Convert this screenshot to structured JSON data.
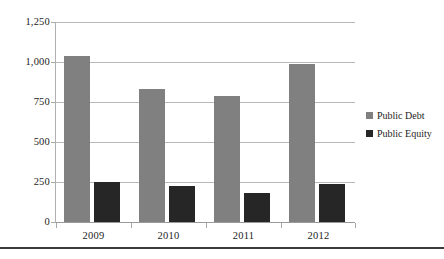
{
  "chart_data": {
    "type": "bar",
    "title": "",
    "subtitle": "",
    "xlabel": "",
    "ylabel": "",
    "categories": [
      "2009",
      "2010",
      "2011",
      "2012"
    ],
    "series": [
      {
        "name": "Public Debt",
        "color": "#808080",
        "values": [
          1035,
          832,
          785,
          985
        ]
      },
      {
        "name": "Public Equity",
        "color": "#262626",
        "values": [
          253,
          228,
          180,
          237
        ]
      }
    ],
    "ylim": [
      0,
      1250
    ],
    "y_ticks": [
      0,
      250,
      500,
      750,
      1000,
      1250
    ],
    "y_tick_labels": [
      "0",
      "250",
      "500",
      "750",
      "1,000",
      "1,250"
    ],
    "grid": true,
    "legend_position": "right"
  },
  "legend": {
    "items": [
      {
        "label": "Public Debt",
        "color": "#808080"
      },
      {
        "label": "Public Equity",
        "color": "#262626"
      }
    ]
  }
}
